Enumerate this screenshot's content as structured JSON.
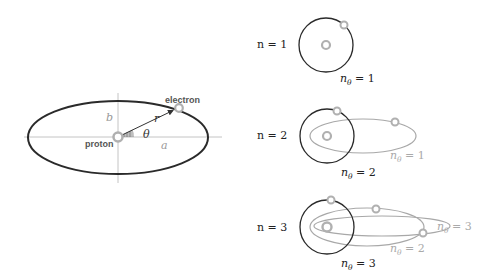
{
  "colors": {
    "orbit_dark": "#2a2a2a",
    "orbit_gray": "#a8a8a8",
    "axis": "#c4c4c4",
    "particle": "#b0b0b0",
    "label_dark": "#333333",
    "label_gray": "#9a9a9a"
  },
  "left_panel": {
    "labels": {
      "electron": "electron",
      "proton": "proton",
      "r": "r",
      "theta": "θ",
      "a": "a",
      "b": "b"
    }
  },
  "right_panel": {
    "rows": [
      {
        "n_label": "n = 1",
        "circle_label": "nθ = 1",
        "orbits": [
          {
            "type": "circle",
            "n_theta": 1,
            "label": "nθ = 1"
          }
        ]
      },
      {
        "n_label": "n = 2",
        "circle_label": "nθ = 2",
        "orbits": [
          {
            "type": "circle",
            "n_theta": 2,
            "label": "nθ = 2"
          },
          {
            "type": "ellipse",
            "n_theta": 1,
            "label": "nθ = 1"
          }
        ]
      },
      {
        "n_label": "n = 3",
        "circle_label": "nθ = 3",
        "orbits": [
          {
            "type": "circle",
            "n_theta": 3,
            "label": "nθ = 3"
          },
          {
            "type": "ellipse",
            "n_theta": 2,
            "label": "nθ = 2"
          },
          {
            "type": "ellipse",
            "n_theta": 1,
            "label": "nθ = 3"
          }
        ]
      }
    ],
    "labels": {
      "row1_n": "n = 1",
      "row1_ntheta": "= 1",
      "row2_n": "n = 2",
      "row2_ntheta_circle": "= 2",
      "row2_ntheta_ellipse": "= 1",
      "row3_n": "n = 3",
      "row3_ntheta_circle": "= 3",
      "row3_ntheta_mid": "= 2",
      "row3_ntheta_outer": "= 3",
      "n_symbol": "n",
      "theta_sub": "θ"
    }
  }
}
